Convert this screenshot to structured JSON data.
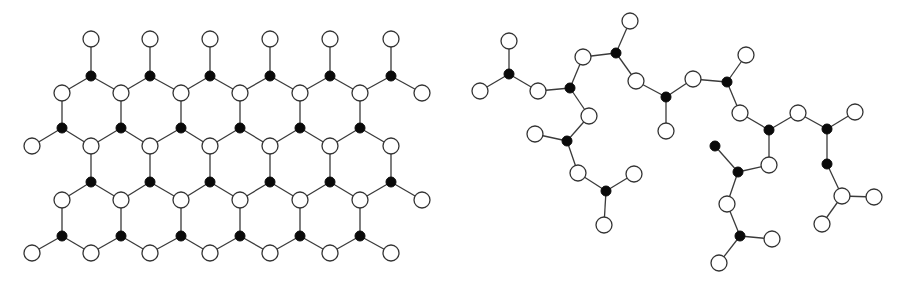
{
  "figure": {
    "panels": [
      {
        "id": "lattice",
        "description": "2D hexagonal network: filled atoms bonded to three open atoms",
        "node_types": {
          "O": "open",
          "F": "filled"
        },
        "nodes": [
          {
            "id": "t1",
            "type": "O"
          },
          {
            "id": "t2",
            "type": "O"
          },
          {
            "id": "t3",
            "type": "O"
          },
          {
            "id": "t4",
            "type": "O"
          },
          {
            "id": "t5",
            "type": "O"
          },
          {
            "id": "t6",
            "type": "O"
          },
          {
            "id": "a1",
            "type": "F"
          },
          {
            "id": "a2",
            "type": "F"
          },
          {
            "id": "a3",
            "type": "F"
          },
          {
            "id": "a4",
            "type": "F"
          },
          {
            "id": "a5",
            "type": "F"
          },
          {
            "id": "a6",
            "type": "F"
          },
          {
            "id": "b1",
            "type": "O"
          },
          {
            "id": "b2",
            "type": "O"
          },
          {
            "id": "b3",
            "type": "O"
          },
          {
            "id": "b4",
            "type": "O"
          },
          {
            "id": "b5",
            "type": "O"
          },
          {
            "id": "b6",
            "type": "O"
          },
          {
            "id": "b7",
            "type": "O"
          },
          {
            "id": "c1",
            "type": "F"
          },
          {
            "id": "c2",
            "type": "F"
          },
          {
            "id": "c3",
            "type": "F"
          },
          {
            "id": "c4",
            "type": "F"
          },
          {
            "id": "c5",
            "type": "F"
          },
          {
            "id": "c6",
            "type": "F"
          },
          {
            "id": "d0",
            "type": "O"
          },
          {
            "id": "d1",
            "type": "O"
          },
          {
            "id": "d2",
            "type": "O"
          },
          {
            "id": "d3",
            "type": "O"
          },
          {
            "id": "d4",
            "type": "O"
          },
          {
            "id": "d5",
            "type": "O"
          },
          {
            "id": "d6",
            "type": "O"
          },
          {
            "id": "e1",
            "type": "F"
          },
          {
            "id": "e2",
            "type": "F"
          },
          {
            "id": "e3",
            "type": "F"
          },
          {
            "id": "e4",
            "type": "F"
          },
          {
            "id": "e5",
            "type": "F"
          },
          {
            "id": "e6",
            "type": "F"
          },
          {
            "id": "f1",
            "type": "O"
          },
          {
            "id": "f2",
            "type": "O"
          },
          {
            "id": "f3",
            "type": "O"
          },
          {
            "id": "f4",
            "type": "O"
          },
          {
            "id": "f5",
            "type": "O"
          },
          {
            "id": "f6",
            "type": "O"
          },
          {
            "id": "f7",
            "type": "O"
          },
          {
            "id": "g1",
            "type": "F"
          },
          {
            "id": "g2",
            "type": "F"
          },
          {
            "id": "g3",
            "type": "F"
          },
          {
            "id": "g4",
            "type": "F"
          },
          {
            "id": "g5",
            "type": "F"
          },
          {
            "id": "g6",
            "type": "F"
          },
          {
            "id": "h0",
            "type": "O"
          },
          {
            "id": "h1",
            "type": "O"
          },
          {
            "id": "h2",
            "type": "O"
          },
          {
            "id": "h3",
            "type": "O"
          },
          {
            "id": "h4",
            "type": "O"
          },
          {
            "id": "h5",
            "type": "O"
          },
          {
            "id": "h6",
            "type": "O"
          }
        ]
      },
      {
        "id": "chain",
        "description": "Branched chain network: filled atoms bonded to three open atoms",
        "node_types": {
          "O": "open",
          "F": "filled"
        },
        "nodes": [
          {
            "id": "r1",
            "type": "O"
          },
          {
            "id": "r2",
            "type": "F"
          },
          {
            "id": "r3",
            "type": "O"
          },
          {
            "id": "r4",
            "type": "O"
          },
          {
            "id": "r5",
            "type": "F"
          },
          {
            "id": "r6",
            "type": "O"
          },
          {
            "id": "r7",
            "type": "F"
          },
          {
            "id": "r8",
            "type": "O"
          },
          {
            "id": "r9",
            "type": "O"
          },
          {
            "id": "r10",
            "type": "F"
          },
          {
            "id": "r11",
            "type": "O"
          },
          {
            "id": "r12",
            "type": "O"
          },
          {
            "id": "r13",
            "type": "F"
          },
          {
            "id": "r14",
            "type": "O"
          },
          {
            "id": "r15",
            "type": "O"
          },
          {
            "id": "r16",
            "type": "F"
          },
          {
            "id": "r17",
            "type": "O"
          },
          {
            "id": "r18",
            "type": "O"
          },
          {
            "id": "r19",
            "type": "F"
          },
          {
            "id": "r20",
            "type": "O"
          },
          {
            "id": "r21",
            "type": "O"
          },
          {
            "id": "r22",
            "type": "F"
          },
          {
            "id": "r23",
            "type": "O"
          },
          {
            "id": "r24",
            "type": "F"
          },
          {
            "id": "r25",
            "type": "O"
          },
          {
            "id": "r26",
            "type": "O"
          },
          {
            "id": "r27",
            "type": "F"
          },
          {
            "id": "r28",
            "type": "O"
          },
          {
            "id": "r29",
            "type": "F"
          },
          {
            "id": "r30",
            "type": "O"
          },
          {
            "id": "r31",
            "type": "O"
          },
          {
            "id": "r32",
            "type": "O"
          },
          {
            "id": "r33",
            "type": "F"
          },
          {
            "id": "r34",
            "type": "O"
          },
          {
            "id": "r35",
            "type": "F"
          },
          {
            "id": "r36",
            "type": "O"
          },
          {
            "id": "r37",
            "type": "O"
          },
          {
            "id": "r38",
            "type": "O"
          },
          {
            "id": "r39",
            "type": "F"
          },
          {
            "id": "r40",
            "type": "O"
          },
          {
            "id": "r41",
            "type": "O"
          }
        ],
        "bonds": [
          [
            "r1",
            "r2"
          ],
          [
            "r2",
            "r3"
          ],
          [
            "r2",
            "r4"
          ],
          [
            "r4",
            "r5"
          ],
          [
            "r5",
            "r6"
          ],
          [
            "r6",
            "r7"
          ],
          [
            "r7",
            "r8"
          ],
          [
            "r7",
            "r9"
          ],
          [
            "r5",
            "r11"
          ],
          [
            "r11",
            "r10"
          ],
          [
            "r10",
            "r12"
          ],
          [
            "r10",
            "r14"
          ],
          [
            "r14",
            "r13"
          ],
          [
            "r13",
            "r15"
          ],
          [
            "r13",
            "r17"
          ],
          [
            "r9",
            "r16"
          ],
          [
            "r16",
            "r18"
          ],
          [
            "r16",
            "r19a"
          ],
          [
            "r16",
            "r20"
          ],
          [
            "r20",
            "r22"
          ],
          [
            "r22",
            "r21"
          ],
          [
            "r22",
            "r23"
          ],
          [
            "r23",
            "r24"
          ],
          [
            "r24",
            "r25"
          ],
          [
            "r24",
            "r26"
          ],
          [
            "r26",
            "r27"
          ],
          [
            "r27",
            "r28"
          ],
          [
            "r27",
            "r29"
          ],
          [
            "r29",
            "r30"
          ],
          [
            "r30",
            "r31"
          ],
          [
            "r31",
            "r33"
          ],
          [
            "r33",
            "r32"
          ],
          [
            "r33",
            "r34"
          ],
          [
            "r25",
            "r35"
          ],
          [
            "r35",
            "r36"
          ],
          [
            "r35",
            "r37"
          ],
          [
            "r37",
            "r38"
          ],
          [
            "r38",
            "r39"
          ],
          [
            "r39",
            "r40"
          ],
          [
            "r39",
            "r41"
          ]
        ]
      }
    ]
  }
}
